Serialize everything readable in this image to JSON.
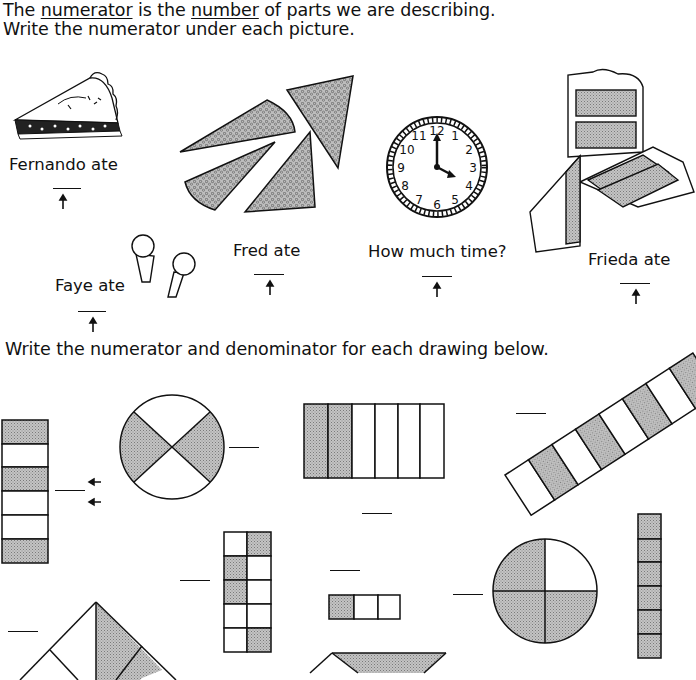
{
  "header": {
    "line1_parts": [
      "The ",
      "numerator",
      " is the ",
      "number",
      " of parts we are describing."
    ],
    "line2": "Write the numerator under each picture."
  },
  "section1": {
    "items": [
      {
        "label": "Fernando ate",
        "picture": "pie-slice"
      },
      {
        "label": "Faye ate",
        "picture": "two-lollipops"
      },
      {
        "label": "Fred ate",
        "picture": "four-pizza-slices"
      },
      {
        "label": "How much time?",
        "picture": "clock-4-oclock"
      },
      {
        "label": "Frieda  ate",
        "picture": "three-cake-slices"
      }
    ],
    "clock_numbers": [
      "12",
      "1",
      "2",
      "3",
      "4",
      "5",
      "6",
      "7",
      "8",
      "9",
      "10",
      "11"
    ]
  },
  "section2": {
    "instruction": "Write the numerator and denominator for each drawing below.",
    "drawings": [
      {
        "shape": "vertical-strip",
        "parts": 6,
        "shaded": 3
      },
      {
        "shape": "circle-x",
        "parts": 4,
        "shaded": 2
      },
      {
        "shape": "rectangle-columns",
        "parts": 6,
        "shaded": 2
      },
      {
        "shape": "diagonal-strip",
        "parts": 8,
        "shaded": 3
      },
      {
        "shape": "grid-2x5",
        "parts": 10,
        "shaded": 4
      },
      {
        "shape": "row-of-3",
        "parts": 3,
        "shaded": 1
      },
      {
        "shape": "circle-quarters",
        "parts": 4,
        "shaded": 3
      },
      {
        "shape": "vertical-strip-full",
        "parts": 6,
        "shaded": 6
      },
      {
        "shape": "triangle",
        "parts": 4,
        "shaded": 1
      },
      {
        "shape": "trapezoid",
        "parts": 2,
        "shaded": 1
      }
    ]
  },
  "colors": {
    "ink": "#111111",
    "shade": "#b8b8b8",
    "paper": "#ffffff"
  }
}
